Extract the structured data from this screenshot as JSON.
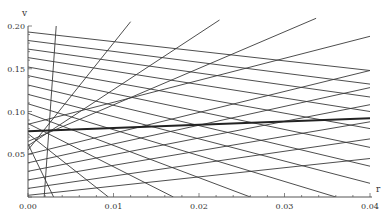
{
  "chart_data": {
    "type": "line",
    "title": "",
    "xlabel": "r",
    "ylabel": "v",
    "xlim": [
      0,
      0.04
    ],
    "ylim": [
      0,
      0.2
    ],
    "grid": false,
    "legend": "none",
    "x_ticks": [
      "0.00",
      "0.01",
      "0.02",
      "0.03",
      "0.04"
    ],
    "y_ticks": [
      "0.05",
      "0.10",
      "0.15",
      "0.20"
    ],
    "colors": {
      "thin": "#3a3a3a",
      "thick": "#222222",
      "axis": "#555555"
    },
    "series": [
      {
        "name": "descending-1",
        "x": [
          0,
          0.04
        ],
        "y": [
          0.193,
          0.148
        ]
      },
      {
        "name": "descending-2",
        "x": [
          0,
          0.04
        ],
        "y": [
          0.183,
          0.132
        ]
      },
      {
        "name": "descending-3",
        "x": [
          0,
          0.04
        ],
        "y": [
          0.173,
          0.117
        ]
      },
      {
        "name": "descending-4",
        "x": [
          0,
          0.04
        ],
        "y": [
          0.163,
          0.1
        ]
      },
      {
        "name": "descending-5",
        "x": [
          0,
          0.04
        ],
        "y": [
          0.152,
          0.08
        ]
      },
      {
        "name": "descending-6",
        "x": [
          0,
          0.04
        ],
        "y": [
          0.142,
          0.058
        ]
      },
      {
        "name": "descending-7",
        "x": [
          0,
          0.04
        ],
        "y": [
          0.131,
          0.036
        ]
      },
      {
        "name": "descending-8",
        "x": [
          0,
          0.04
        ],
        "y": [
          0.12,
          0.016
        ]
      },
      {
        "name": "descending-9",
        "x": [
          0,
          0.036
        ],
        "y": [
          0.109,
          0.0
        ]
      },
      {
        "name": "descending-10",
        "x": [
          0,
          0.026
        ],
        "y": [
          0.098,
          0.0
        ]
      },
      {
        "name": "descending-11",
        "x": [
          0,
          0.017
        ],
        "y": [
          0.086,
          0.0
        ]
      },
      {
        "name": "descending-12",
        "x": [
          0,
          0.0094
        ],
        "y": [
          0.074,
          0.0
        ]
      },
      {
        "name": "descending-13",
        "x": [
          0,
          0.003
        ],
        "y": [
          0.062,
          0.0
        ]
      },
      {
        "name": "ascending-1",
        "x": [
          0,
          0.04
        ],
        "y": [
          0.05,
          0.148
        ]
      },
      {
        "name": "ascending-2",
        "x": [
          0,
          0.04
        ],
        "y": [
          0.04,
          0.128
        ]
      },
      {
        "name": "ascending-3",
        "x": [
          0,
          0.04
        ],
        "y": [
          0.03,
          0.108
        ]
      },
      {
        "name": "ascending-4",
        "x": [
          0,
          0.04
        ],
        "y": [
          0.02,
          0.088
        ]
      },
      {
        "name": "ascending-5",
        "x": [
          0,
          0.04
        ],
        "y": [
          0.01,
          0.068
        ]
      },
      {
        "name": "ascending-6",
        "x": [
          0,
          0.04
        ],
        "y": [
          0.002,
          0.045
        ]
      },
      {
        "name": "steep-1",
        "x": [
          0.0019,
          0.0033
        ],
        "y": [
          0.0,
          0.2
        ]
      },
      {
        "name": "steep-2",
        "x": [
          0.0,
          0.012
        ],
        "y": [
          0.055,
          0.205
        ]
      },
      {
        "name": "steep-3",
        "x": [
          0.0,
          0.0224
        ],
        "y": [
          0.06,
          0.207
        ]
      },
      {
        "name": "steep-4",
        "x": [
          0.0,
          0.0337
        ],
        "y": [
          0.065,
          0.209
        ]
      },
      {
        "name": "steep-5",
        "x": [
          0.0,
          0.04
        ],
        "y": [
          0.085,
          0.188
        ]
      },
      {
        "name": "highlight",
        "x": [
          0,
          0.04
        ],
        "y": [
          0.077,
          0.092
        ],
        "thick": true
      }
    ]
  }
}
